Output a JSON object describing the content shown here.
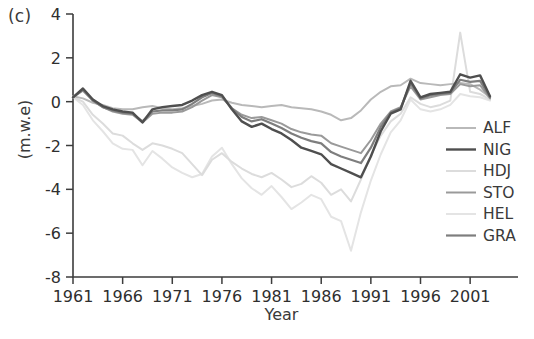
{
  "panel": {
    "label": "(c)"
  },
  "chart_data": {
    "type": "line",
    "title": "",
    "xlabel": "Year",
    "ylabel": "(m.w.e)",
    "xlim": [
      1961,
      2003
    ],
    "ylim": [
      -8,
      4
    ],
    "grid": false,
    "legend_position": "right-inside",
    "xticks": [
      1961,
      1966,
      1971,
      1976,
      1981,
      1986,
      1991,
      1996,
      2001
    ],
    "xtick_labels": [
      "1961",
      "1966",
      "1971",
      "1976",
      "1981",
      "1986",
      "1991",
      "1996",
      "2001"
    ],
    "yticks": [
      4,
      2,
      0,
      -2,
      -4,
      -6,
      -8
    ],
    "ytick_labels": [
      "4",
      "2",
      "0",
      "-2",
      "-4",
      "-6",
      "-8"
    ],
    "x": [
      1961,
      1962,
      1963,
      1964,
      1965,
      1966,
      1967,
      1968,
      1969,
      1970,
      1971,
      1972,
      1973,
      1974,
      1975,
      1976,
      1977,
      1978,
      1979,
      1980,
      1981,
      1982,
      1983,
      1984,
      1985,
      1986,
      1987,
      1988,
      1989,
      1990,
      1991,
      1992,
      1993,
      1994,
      1995,
      1996,
      1997,
      1998,
      1999,
      2000,
      2001,
      2002,
      2003
    ],
    "series": [
      {
        "name": "ALF",
        "color": "#b9b9b9",
        "width": 2.0,
        "values": [
          0.25,
          0.15,
          -0.05,
          -0.15,
          -0.3,
          -0.35,
          -0.35,
          -0.25,
          -0.2,
          -0.3,
          -0.35,
          -0.3,
          -0.2,
          -0.1,
          0.05,
          0.1,
          -0.05,
          -0.15,
          -0.2,
          -0.25,
          -0.2,
          -0.15,
          -0.25,
          -0.3,
          -0.35,
          -0.45,
          -0.6,
          -0.85,
          -0.75,
          -0.4,
          0.1,
          0.45,
          0.7,
          0.75,
          1.05,
          0.85,
          0.8,
          0.75,
          0.8,
          0.85,
          0.8,
          0.55,
          0.2
        ]
      },
      {
        "name": "NIG",
        "color": "#4f4f4f",
        "width": 2.4,
        "values": [
          0.2,
          0.6,
          0.1,
          -0.2,
          -0.35,
          -0.45,
          -0.5,
          -0.95,
          -0.35,
          -0.25,
          -0.2,
          -0.15,
          0.05,
          0.3,
          0.45,
          0.3,
          -0.35,
          -0.9,
          -1.15,
          -1.0,
          -1.25,
          -1.45,
          -1.75,
          -2.1,
          -2.25,
          -2.4,
          -2.85,
          -3.05,
          -3.25,
          -3.45,
          -2.5,
          -1.35,
          -0.55,
          -0.35,
          0.95,
          0.2,
          0.35,
          0.4,
          0.45,
          1.25,
          1.1,
          1.2,
          0.25
        ]
      },
      {
        "name": "HDJ",
        "color": "#dcdcdc",
        "width": 2.0,
        "values": [
          0.2,
          0.0,
          -0.6,
          -1.0,
          -1.45,
          -1.55,
          -1.9,
          -2.2,
          -1.9,
          -2.0,
          -2.15,
          -2.35,
          -2.85,
          -3.35,
          -2.65,
          -2.35,
          -2.75,
          -3.05,
          -3.3,
          -3.45,
          -3.25,
          -3.55,
          -3.9,
          -3.75,
          -3.4,
          -3.7,
          -4.25,
          -4.0,
          -4.55,
          -3.55,
          -2.45,
          -1.55,
          -0.9,
          -0.55,
          0.2,
          -0.1,
          -0.25,
          -0.15,
          0.05,
          3.15,
          0.45,
          0.35,
          0.1
        ]
      },
      {
        "name": "STO",
        "color": "#9a9a9a",
        "width": 2.0,
        "values": [
          0.2,
          0.5,
          0.05,
          -0.25,
          -0.45,
          -0.55,
          -0.6,
          -0.95,
          -0.55,
          -0.5,
          -0.5,
          -0.45,
          -0.25,
          0.05,
          0.3,
          0.2,
          -0.3,
          -0.6,
          -0.75,
          -0.7,
          -0.85,
          -1.0,
          -1.25,
          -1.4,
          -1.5,
          -1.55,
          -1.9,
          -2.05,
          -2.2,
          -2.35,
          -1.75,
          -1.0,
          -0.45,
          -0.25,
          0.7,
          0.1,
          0.2,
          0.3,
          0.35,
          0.8,
          0.7,
          0.75,
          0.15
        ]
      },
      {
        "name": "HEL",
        "color": "#e4e4e4",
        "width": 2.0,
        "values": [
          0.2,
          -0.15,
          -0.85,
          -1.35,
          -1.9,
          -2.15,
          -2.2,
          -2.9,
          -2.25,
          -2.6,
          -3.0,
          -3.25,
          -3.45,
          -3.3,
          -2.5,
          -2.1,
          -2.85,
          -3.5,
          -3.95,
          -4.25,
          -3.85,
          -4.35,
          -4.9,
          -4.6,
          -4.25,
          -4.45,
          -5.25,
          -5.45,
          -6.8,
          -5.05,
          -3.6,
          -2.4,
          -1.4,
          -0.85,
          0.1,
          -0.35,
          -0.45,
          -0.35,
          -0.15,
          0.35,
          0.25,
          0.2,
          0.05
        ]
      },
      {
        "name": "GRA",
        "color": "#7e7e7e",
        "width": 2.2,
        "values": [
          0.2,
          0.55,
          0.05,
          -0.25,
          -0.4,
          -0.5,
          -0.55,
          -0.9,
          -0.45,
          -0.4,
          -0.4,
          -0.35,
          -0.1,
          0.2,
          0.4,
          0.25,
          -0.3,
          -0.7,
          -0.9,
          -0.8,
          -1.0,
          -1.2,
          -1.45,
          -1.65,
          -1.8,
          -1.9,
          -2.3,
          -2.5,
          -2.65,
          -2.8,
          -2.1,
          -1.15,
          -0.5,
          -0.3,
          0.85,
          0.15,
          0.3,
          0.35,
          0.4,
          1.0,
          0.9,
          0.95,
          0.2
        ]
      }
    ]
  },
  "legend": {
    "items": [
      {
        "label": "ALF",
        "color": "#b9b9b9"
      },
      {
        "label": "NIG",
        "color": "#4f4f4f"
      },
      {
        "label": "HDJ",
        "color": "#dcdcdc"
      },
      {
        "label": "STO",
        "color": "#9a9a9a"
      },
      {
        "label": "HEL",
        "color": "#e4e4e4"
      },
      {
        "label": "GRA",
        "color": "#7e7e7e"
      }
    ]
  }
}
